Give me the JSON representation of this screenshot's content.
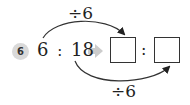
{
  "problem": {
    "number": "6",
    "left_ratio": {
      "first": "6",
      "separator": ":",
      "second": "18"
    },
    "right_ratio": {
      "first_box": "",
      "separator": ":",
      "second_box": ""
    },
    "top_operation": "÷6",
    "bottom_operation": "÷6"
  },
  "colors": {
    "badge": "#d9d9d9",
    "arrow": "#cccccc",
    "line": "#333333"
  }
}
